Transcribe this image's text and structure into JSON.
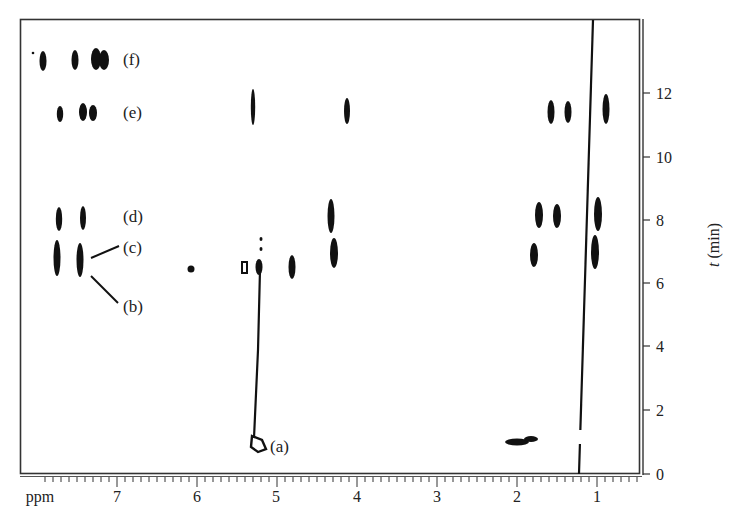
{
  "chart_data": {
    "type": "heatmap",
    "subtype": "2D NMR contour plot (chemical shift vs time)",
    "title": "",
    "xlabel": "ppm",
    "ylabel": "t (min)",
    "xlim": [
      7.95,
      0.45
    ],
    "ylim": [
      0,
      14.3
    ],
    "x_ticks": [
      7,
      6,
      5,
      4,
      3,
      2,
      1
    ],
    "x_tick_labels": [
      "7",
      "6",
      "5",
      "4",
      "3",
      "2",
      "1"
    ],
    "y_ticks": [
      0,
      2,
      4,
      6,
      8,
      10,
      12
    ],
    "y_tick_labels": [
      "0",
      "2",
      "4",
      "6",
      "8",
      "10",
      "12"
    ],
    "grid": false,
    "legend": null,
    "annotations": [
      {
        "label": "(f)",
        "x_ppm": 6.9,
        "t_min": 13.1
      },
      {
        "label": "(e)",
        "x_ppm": 6.9,
        "t_min": 11.5
      },
      {
        "label": "(d)",
        "x_ppm": 6.9,
        "t_min": 8.2
      },
      {
        "label": "(c)",
        "x_ppm": 6.9,
        "t_min": 7.2
      },
      {
        "label": "(b)",
        "x_ppm": 6.9,
        "t_min": 5.3
      },
      {
        "label": "(a)",
        "x_ppm": 5.1,
        "t_min": 0.9
      }
    ],
    "series": [
      {
        "name": "row (f)",
        "t_min": 13.1,
        "peaks_ppm": [
          7.78,
          7.4,
          7.25
        ]
      },
      {
        "name": "row (e)",
        "t_min": 11.5,
        "peaks_ppm": [
          7.6,
          7.38,
          7.25,
          5.3,
          4.15,
          1.62,
          1.42,
          0.93
        ]
      },
      {
        "name": "row (d)",
        "t_min": 8.2,
        "peaks_ppm": [
          7.68,
          7.38,
          4.33,
          1.8,
          1.53,
          1.05
        ]
      },
      {
        "name": "rows (b)/(c)",
        "t_min": 6.8,
        "peaks_ppm": [
          7.7,
          7.4,
          6.05,
          5.4,
          5.28,
          4.8,
          4.3,
          1.83,
          1.07
        ]
      },
      {
        "name": "(a) start",
        "t_min": 0.9,
        "peaks_ppm": [
          5.2,
          1.9
        ]
      }
    ],
    "lines": [
      {
        "name": "drift line (a)",
        "from": {
          "ppm": 5.3,
          "t": 6.7
        },
        "to": {
          "ppm": 5.22,
          "t": 1.0
        }
      },
      {
        "name": "solvent/reference line",
        "from": {
          "ppm": 0.95,
          "t": 14.3
        },
        "to": {
          "ppm": 1.25,
          "t": 0
        }
      }
    ]
  },
  "axes": {
    "x_unit_label": "ppm",
    "x_labels": [
      "7",
      "6",
      "5",
      "4",
      "3",
      "2",
      "1"
    ],
    "y_labels": [
      "0",
      "2",
      "4",
      "6",
      "8",
      "10",
      "12"
    ],
    "y_title_italic": "t",
    "y_title_rest": " (min)"
  },
  "annotation_labels": {
    "a": "(a)",
    "b": "(b)",
    "c": "(c)",
    "d": "(d)",
    "e": "(e)",
    "f": "(f)"
  }
}
